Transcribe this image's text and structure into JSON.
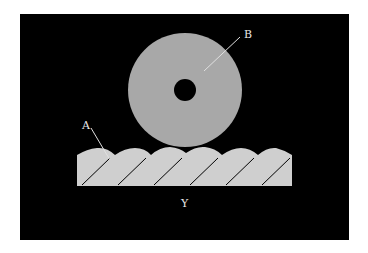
{
  "diagram": {
    "labels": {
      "a": "A",
      "b": "B",
      "y": "Y"
    },
    "colors": {
      "background": "#ffffff",
      "panel": "#000000",
      "wheel": "#a8a8a8",
      "hole": "#000000",
      "slab": "#cfcfcf",
      "hatch": "#000000",
      "leader": "#e0e0e0"
    }
  }
}
